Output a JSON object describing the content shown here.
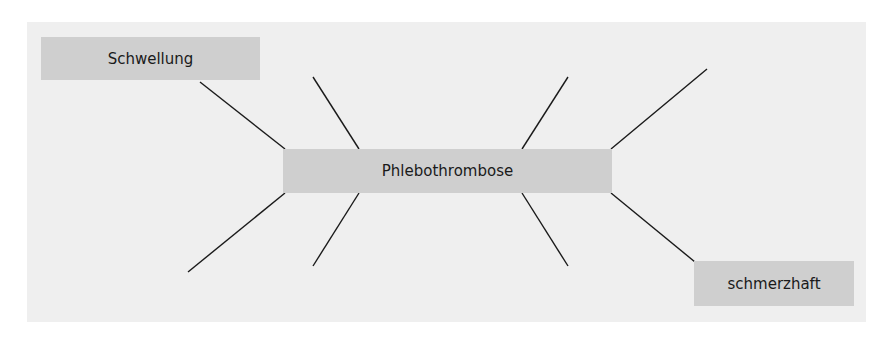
{
  "diagram": {
    "type": "mind-map",
    "center": {
      "label": "Phlebothrombose"
    },
    "branches": [
      {
        "label": "Schwellung",
        "position": "top-left"
      },
      {
        "label": "",
        "position": "top-inner-left"
      },
      {
        "label": "",
        "position": "top-inner-right"
      },
      {
        "label": "",
        "position": "top-right"
      },
      {
        "label": "",
        "position": "bottom-left"
      },
      {
        "label": "",
        "position": "bottom-inner-left"
      },
      {
        "label": "",
        "position": "bottom-inner-right"
      },
      {
        "label": "schmerzhaft",
        "position": "bottom-right"
      }
    ],
    "colors": {
      "panel": "#efefef",
      "box": "#cfcfcf",
      "line": "#1a1a1a",
      "text": "#1a1a1a"
    }
  }
}
